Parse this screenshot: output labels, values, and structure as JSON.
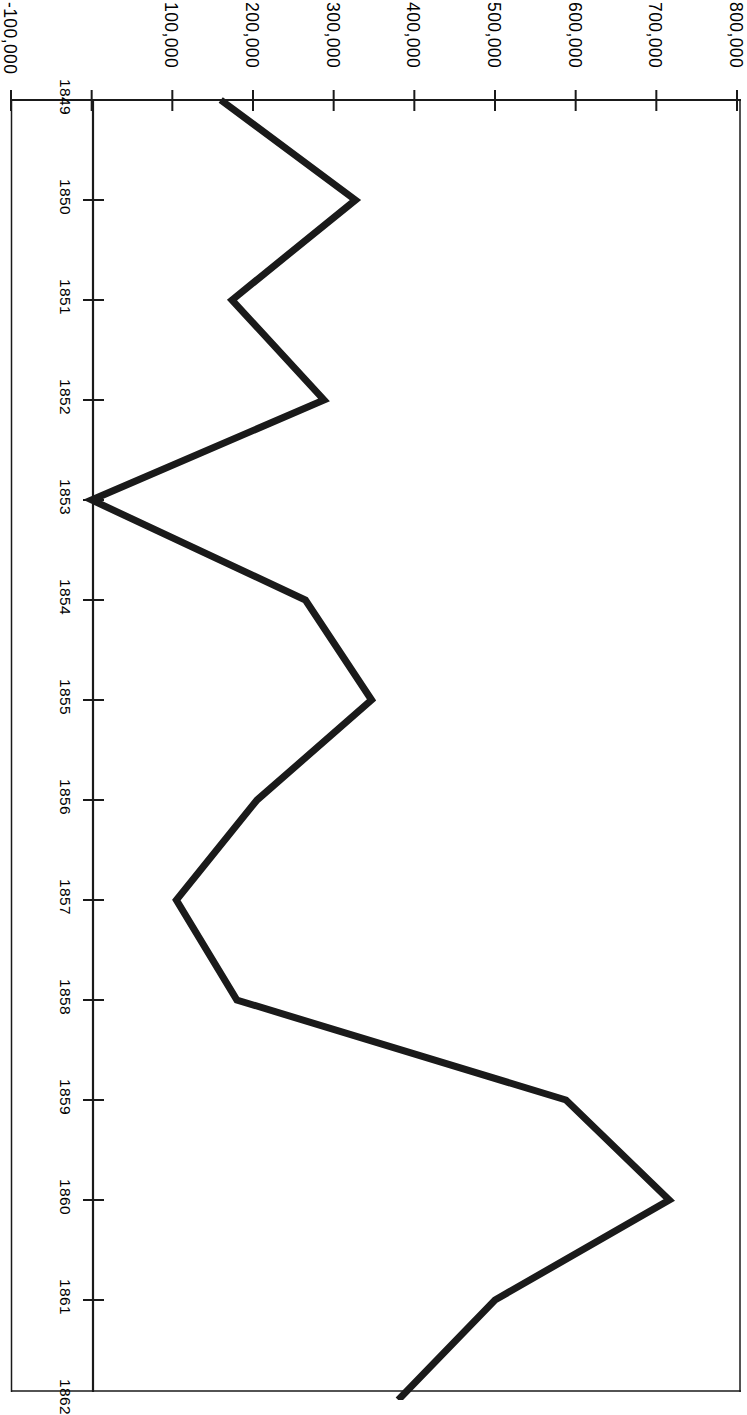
{
  "chart_data": {
    "type": "line",
    "title": "",
    "subtitle": "",
    "orientation": "rotated-90",
    "xlabel": "",
    "ylabel": "",
    "x": [
      1849,
      1850,
      1851,
      1852,
      1853,
      1854,
      1855,
      1856,
      1857,
      1858,
      1859,
      1860,
      1861,
      1862
    ],
    "categories": [
      "1849",
      "1850",
      "1851",
      "1852",
      "1853",
      "1854",
      "1855",
      "1856",
      "1857",
      "1858",
      "1859",
      "1860",
      "1861",
      "1862"
    ],
    "values": [
      160000,
      327000,
      174000,
      288000,
      0,
      265000,
      347000,
      205000,
      105000,
      180000,
      588000,
      716000,
      500000,
      380000
    ],
    "series": [
      {
        "name": "",
        "values": [
          160000,
          327000,
          174000,
          288000,
          0,
          265000,
          347000,
          205000,
          105000,
          180000,
          588000,
          716000,
          500000,
          380000
        ]
      }
    ],
    "value_axis": {
      "min": -100000,
      "max": 800000,
      "tick_step": 100000,
      "tick_labels": [
        "-100,000",
        "",
        "100,000",
        "200,000",
        "300,000",
        "400,000",
        "500,000",
        "600,000",
        "700,000",
        "800,000"
      ],
      "tick_values": [
        -100000,
        0,
        100000,
        200000,
        300000,
        400000,
        500000,
        600000,
        700000,
        800000
      ]
    },
    "category_axis": {
      "min": 1849,
      "max": 1862,
      "tick_labels": [
        "1849",
        "1850",
        "1851",
        "1852",
        "1853",
        "1854",
        "1855",
        "1856",
        "1857",
        "1858",
        "1859",
        "1860",
        "1861",
        "1862"
      ]
    },
    "grid": false,
    "legend": null,
    "legend_position": "none",
    "line_color": "#1a1a1a",
    "axis_color": "#1a1a1a",
    "background_color": "#ffffff"
  },
  "axes": {
    "value_ticks": [
      {
        "label": "-100,000",
        "value": -100000
      },
      {
        "label": "",
        "value": 0
      },
      {
        "label": "100,000",
        "value": 100000
      },
      {
        "label": "200,000",
        "value": 200000
      },
      {
        "label": "300,000",
        "value": 300000
      },
      {
        "label": "400,000",
        "value": 400000
      },
      {
        "label": "500,000",
        "value": 500000
      },
      {
        "label": "600,000",
        "value": 600000
      },
      {
        "label": "700,000",
        "value": 700000
      },
      {
        "label": "800,000",
        "value": 800000
      }
    ],
    "year_ticks": [
      {
        "label": "1849",
        "value": 1849
      },
      {
        "label": "1850",
        "value": 1850
      },
      {
        "label": "1851",
        "value": 1851
      },
      {
        "label": "1852",
        "value": 1852
      },
      {
        "label": "1853",
        "value": 1853
      },
      {
        "label": "1854",
        "value": 1854
      },
      {
        "label": "1855",
        "value": 1855
      },
      {
        "label": "1856",
        "value": 1856
      },
      {
        "label": "1857",
        "value": 1857
      },
      {
        "label": "1858",
        "value": 1858
      },
      {
        "label": "1859",
        "value": 1859
      },
      {
        "label": "1860",
        "value": 1860
      },
      {
        "label": "1861",
        "value": 1861
      },
      {
        "label": "1862",
        "value": 1862
      }
    ]
  }
}
